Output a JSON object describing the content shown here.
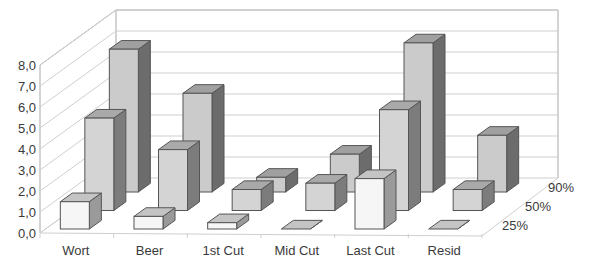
{
  "chart_data": {
    "type": "bar",
    "subtype": "3d-column",
    "title": "",
    "xlabel": "",
    "ylabel": "",
    "categories": [
      "Wort",
      "Beer",
      "1st Cut",
      "Mid Cut",
      "Last Cut",
      "Resid"
    ],
    "series": [
      {
        "name": "25%",
        "values": [
          1.3,
          0.6,
          0.3,
          0.0,
          2.4,
          0.0
        ]
      },
      {
        "name": "50%",
        "values": [
          4.4,
          2.9,
          1.0,
          1.3,
          4.8,
          1.0
        ]
      },
      {
        "name": "90%",
        "values": [
          6.8,
          4.7,
          0.7,
          1.8,
          7.1,
          2.7
        ]
      }
    ],
    "yticks": [
      "0,0",
      "1,0",
      "2,0",
      "3,0",
      "4,0",
      "5,0",
      "6,0",
      "7,0",
      "8,0"
    ],
    "ylim": [
      0,
      8
    ],
    "grid": true,
    "legend": "none (series names on depth axis)",
    "colors": {
      "25%": {
        "front": "#f6f6f6",
        "top": "#c4c4c4",
        "side": "#9a9a9a"
      },
      "50%": {
        "front": "#d4d4d4",
        "top": "#a9a9a9",
        "side": "#7c7c7c"
      },
      "90%": {
        "front": "#cbcbcb",
        "top": "#a0a0a0",
        "side": "#6c6c6c"
      },
      "edge": "#555555",
      "grid": "#cfcfcf",
      "wall": "#a8a8a8"
    }
  }
}
